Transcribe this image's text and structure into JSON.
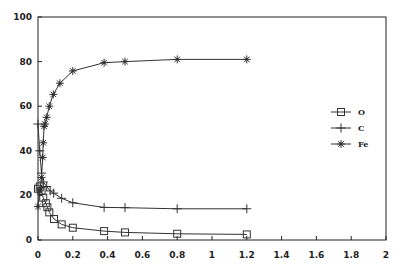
{
  "chart_data": {
    "type": "line",
    "title": "",
    "xlabel": "",
    "ylabel": "",
    "xlim": [
      0,
      2
    ],
    "ylim": [
      0,
      100
    ],
    "x_ticks": [
      "0",
      "0.2",
      "0.4",
      "0.6",
      "0.8",
      "1",
      "1.2",
      "1.4",
      "1.6",
      "1.8",
      "2"
    ],
    "y_ticks": [
      "0",
      "20",
      "40",
      "60",
      "80",
      "100"
    ],
    "grid": false,
    "legend_position": "right",
    "series": [
      {
        "name": "O",
        "marker": "square",
        "x": [
          0.0,
          0.01,
          0.02,
          0.03,
          0.045,
          0.054,
          0.065,
          0.092,
          0.136,
          0.2,
          0.38,
          0.5,
          0.8,
          1.2
        ],
        "y": [
          23,
          24,
          22,
          19,
          16.5,
          14.7,
          12.4,
          9.4,
          7,
          5.5,
          4,
          3.4,
          2.8,
          2.5
        ]
      },
      {
        "name": "C",
        "marker": "plus",
        "x": [
          0.0,
          0.01,
          0.02,
          0.03,
          0.05,
          0.07,
          0.09,
          0.136,
          0.2,
          0.38,
          0.5,
          0.8,
          1.2
        ],
        "y": [
          52,
          40,
          30,
          26,
          24,
          22,
          21,
          18.7,
          16.7,
          14.6,
          14.5,
          14,
          14
        ]
      },
      {
        "name": "Fe",
        "marker": "asterisk",
        "x": [
          0.0,
          0.01,
          0.02,
          0.027,
          0.03,
          0.035,
          0.04,
          0.05,
          0.065,
          0.088,
          0.126,
          0.2,
          0.38,
          0.5,
          0.8,
          1.2
        ],
        "y": [
          15,
          22,
          28,
          37,
          43.6,
          51,
          52,
          55,
          60,
          65.3,
          70.3,
          75.8,
          79.5,
          80,
          81,
          81
        ]
      }
    ]
  },
  "legend": {
    "items": [
      {
        "label": "O",
        "marker": "square"
      },
      {
        "label": "C",
        "marker": "plus"
      },
      {
        "label": "Fe",
        "marker": "asterisk"
      }
    ]
  },
  "colors": {
    "line": "#333333",
    "axis": "#222222",
    "background": "#ffffff"
  }
}
